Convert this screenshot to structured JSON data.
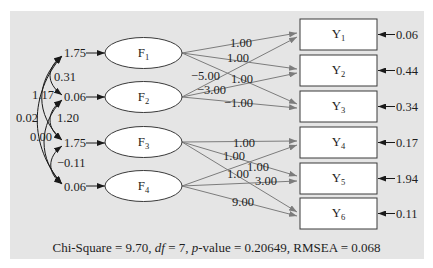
{
  "diagram": {
    "factors": [
      {
        "name": "F",
        "sub": "1",
        "variance": "1.75"
      },
      {
        "name": "F",
        "sub": "2",
        "variance": "0.06"
      },
      {
        "name": "F",
        "sub": "3",
        "variance": "1.75"
      },
      {
        "name": "F",
        "sub": "4",
        "variance": "0.06"
      }
    ],
    "indicators": [
      {
        "name": "Y",
        "sub": "1",
        "residual": "0.06"
      },
      {
        "name": "Y",
        "sub": "2",
        "residual": "0.44"
      },
      {
        "name": "Y",
        "sub": "3",
        "residual": "0.34"
      },
      {
        "name": "Y",
        "sub": "4",
        "residual": "0.17"
      },
      {
        "name": "Y",
        "sub": "5",
        "residual": "1.94"
      },
      {
        "name": "Y",
        "sub": "6",
        "residual": "0.11"
      }
    ],
    "covariances": [
      {
        "from": "F1",
        "to": "F2",
        "value": "0.31"
      },
      {
        "from": "F1",
        "to": "F3",
        "value": "1.17"
      },
      {
        "from": "F1",
        "to": "F4",
        "value": "0.02"
      },
      {
        "from": "F2",
        "to": "F3",
        "value": "1.20"
      },
      {
        "from": "F2",
        "to": "F4",
        "value": "0.00"
      },
      {
        "from": "F3",
        "to": "F4",
        "value": "−0.11"
      }
    ],
    "loadings": [
      {
        "from": "F1",
        "to": "Y1",
        "value": "1.00"
      },
      {
        "from": "F1",
        "to": "Y2",
        "value": "1.00"
      },
      {
        "from": "F1",
        "to": "Y3",
        "value": "1.00"
      },
      {
        "from": "F2",
        "to": "Y1",
        "value": "−5.00"
      },
      {
        "from": "F2",
        "to": "Y2",
        "value": "−3.00"
      },
      {
        "from": "F2",
        "to": "Y3",
        "value": "−1.00"
      },
      {
        "from": "F3",
        "to": "Y4",
        "value": "1.00"
      },
      {
        "from": "F3",
        "to": "Y5",
        "value": "1.00"
      },
      {
        "from": "F3",
        "to": "Y6",
        "value": "1.00"
      },
      {
        "from": "F4",
        "to": "Y4",
        "value": "1.00"
      },
      {
        "from": "F4",
        "to": "Y5",
        "value": "3.00"
      },
      {
        "from": "F4",
        "to": "Y6",
        "value": "9.00"
      }
    ],
    "fit": {
      "part1": "Chi-Square = 9.70, ",
      "df_label": "df",
      "part2": " = 7, ",
      "p_label": "p",
      "part3": "-value = 0.20649, RMSEA = 0.068",
      "chi_square": "9.70",
      "df": "7",
      "p_value": "0.20649",
      "rmsea": "0.068"
    },
    "colors": {
      "panel": "#e5e5e5",
      "loading_lines": "#7c7c7c",
      "covariance_lines": "#1a1a1a"
    }
  }
}
